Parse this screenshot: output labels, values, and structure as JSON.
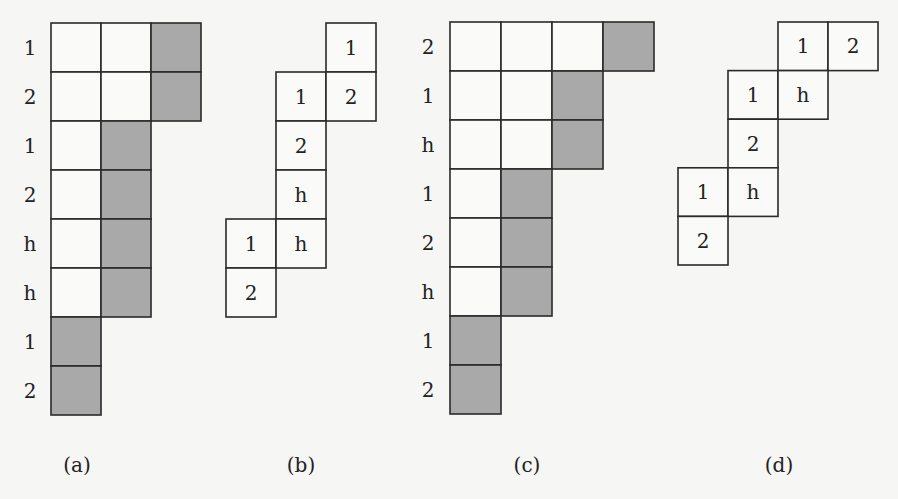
{
  "colors": {
    "shaded": "#a9a9a9",
    "empty": "#fafaf8",
    "line": "#2a2a2a"
  },
  "figures": [
    {
      "caption": "(a)",
      "row_labels": [
        "1",
        "2",
        "1",
        "2",
        "h",
        "h",
        "1",
        "2"
      ],
      "rows": [
        {
          "cells": [
            {
              "col": 0,
              "shaded": false
            },
            {
              "col": 1,
              "shaded": false
            },
            {
              "col": 2,
              "shaded": true
            }
          ]
        },
        {
          "cells": [
            {
              "col": 0,
              "shaded": false
            },
            {
              "col": 1,
              "shaded": false
            },
            {
              "col": 2,
              "shaded": true
            }
          ]
        },
        {
          "cells": [
            {
              "col": 0,
              "shaded": false
            },
            {
              "col": 1,
              "shaded": true
            }
          ]
        },
        {
          "cells": [
            {
              "col": 0,
              "shaded": false
            },
            {
              "col": 1,
              "shaded": true
            }
          ]
        },
        {
          "cells": [
            {
              "col": 0,
              "shaded": false
            },
            {
              "col": 1,
              "shaded": true
            }
          ]
        },
        {
          "cells": [
            {
              "col": 0,
              "shaded": false
            },
            {
              "col": 1,
              "shaded": true
            }
          ]
        },
        {
          "cells": [
            {
              "col": 0,
              "shaded": true
            }
          ]
        },
        {
          "cells": [
            {
              "col": 0,
              "shaded": true
            }
          ]
        }
      ]
    },
    {
      "caption": "(b)",
      "cells": [
        {
          "col": 2,
          "row": 0,
          "text": "1"
        },
        {
          "col": 1,
          "row": 1,
          "text": "1"
        },
        {
          "col": 2,
          "row": 1,
          "text": "2"
        },
        {
          "col": 1,
          "row": 2,
          "text": "2"
        },
        {
          "col": 1,
          "row": 3,
          "text": "h"
        },
        {
          "col": 0,
          "row": 4,
          "text": "1"
        },
        {
          "col": 1,
          "row": 4,
          "text": "h"
        },
        {
          "col": 0,
          "row": 5,
          "text": "2"
        }
      ]
    },
    {
      "caption": "(c)",
      "row_labels": [
        "2",
        "1",
        "h",
        "1",
        "2",
        "h",
        "1",
        "2"
      ],
      "rows": [
        {
          "cells": [
            {
              "col": 0,
              "shaded": false
            },
            {
              "col": 1,
              "shaded": false
            },
            {
              "col": 2,
              "shaded": false
            },
            {
              "col": 3,
              "shaded": true
            }
          ]
        },
        {
          "cells": [
            {
              "col": 0,
              "shaded": false
            },
            {
              "col": 1,
              "shaded": false
            },
            {
              "col": 2,
              "shaded": true
            }
          ]
        },
        {
          "cells": [
            {
              "col": 0,
              "shaded": false
            },
            {
              "col": 1,
              "shaded": false
            },
            {
              "col": 2,
              "shaded": true
            }
          ]
        },
        {
          "cells": [
            {
              "col": 0,
              "shaded": false
            },
            {
              "col": 1,
              "shaded": true
            }
          ]
        },
        {
          "cells": [
            {
              "col": 0,
              "shaded": false
            },
            {
              "col": 1,
              "shaded": true
            }
          ]
        },
        {
          "cells": [
            {
              "col": 0,
              "shaded": false
            },
            {
              "col": 1,
              "shaded": true
            }
          ]
        },
        {
          "cells": [
            {
              "col": 0,
              "shaded": true
            }
          ]
        },
        {
          "cells": [
            {
              "col": 0,
              "shaded": true
            }
          ]
        }
      ]
    },
    {
      "caption": "(d)",
      "cells": [
        {
          "col": 2,
          "row": 0,
          "text": "1"
        },
        {
          "col": 3,
          "row": 0,
          "text": "2"
        },
        {
          "col": 1,
          "row": 1,
          "text": "1"
        },
        {
          "col": 2,
          "row": 1,
          "text": "h"
        },
        {
          "col": 1,
          "row": 2,
          "text": "2"
        },
        {
          "col": 0,
          "row": 3,
          "text": "1"
        },
        {
          "col": 1,
          "row": 3,
          "text": "h"
        },
        {
          "col": 0,
          "row": 4,
          "text": "2"
        }
      ]
    }
  ]
}
